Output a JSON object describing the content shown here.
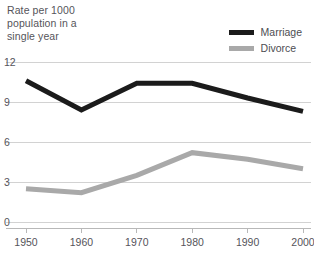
{
  "caption": "Rate per 1000\npopulation in a\nsingle year",
  "legend": {
    "position": "top-right",
    "entries": [
      {
        "label": "Marriage",
        "color": "#1b1b1b",
        "icon": "line-swatch-icon"
      },
      {
        "label": "Divorce",
        "color": "#a9a9a9",
        "icon": "line-swatch-icon"
      }
    ]
  },
  "axes": {
    "y_ticks": [
      "0",
      "3",
      "6",
      "9",
      "12"
    ],
    "x_ticks": [
      "1950",
      "1960",
      "1970",
      "1980",
      "1990",
      "2000"
    ]
  },
  "chart_data": {
    "type": "line",
    "title": "Rate per 1000 population in a single year",
    "xlabel": "",
    "ylabel": "Rate per 1000 population in a single year",
    "x": [
      1950,
      1960,
      1970,
      1980,
      1990,
      2000
    ],
    "categories": [
      "1950",
      "1960",
      "1970",
      "1980",
      "1990",
      "2000"
    ],
    "series": [
      {
        "name": "Marriage",
        "color": "#1b1b1b",
        "values": [
          10.6,
          8.4,
          10.4,
          10.4,
          9.3,
          8.3
        ]
      },
      {
        "name": "Divorce",
        "color": "#a9a9a9",
        "values": [
          2.5,
          2.2,
          3.5,
          5.2,
          4.7,
          4.0
        ]
      }
    ],
    "ylim": [
      0,
      12
    ],
    "yticks": [
      0,
      3,
      6,
      9,
      12
    ],
    "xlim": [
      1950,
      2000
    ],
    "xticks": [
      1950,
      1960,
      1970,
      1980,
      1990,
      2000
    ],
    "grid": "horizontal",
    "legend_position": "top-right"
  }
}
